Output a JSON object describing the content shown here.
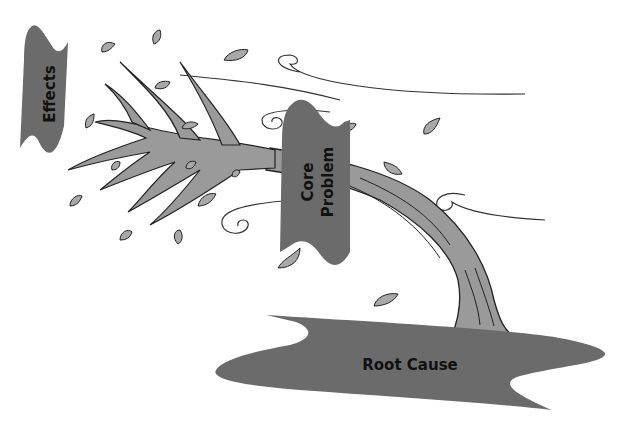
{
  "diagram": {
    "type": "problem-tree",
    "labels": {
      "effects": "Effects",
      "core_line1": "Core",
      "core_line2": "Problem",
      "root": "Root Cause"
    },
    "colors": {
      "banner": "#6b6b6b",
      "tree_fill": "#9a9a9a",
      "leaf_fill": "#a8a8a8",
      "outline": "#222222",
      "background": "#ffffff"
    }
  }
}
